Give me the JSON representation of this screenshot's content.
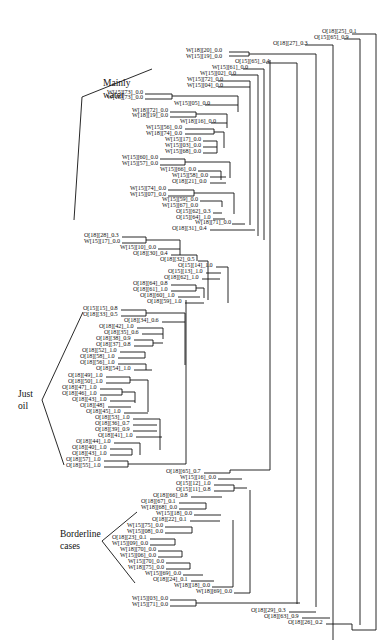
{
  "groups": {
    "mainly_water": {
      "line1": "Mainly",
      "line2": "water"
    },
    "just_oil": {
      "line1": "Just",
      "line2": "oil"
    },
    "borderline": {
      "line1": "Borderline",
      "line2": "cases"
    }
  },
  "leaves": [
    {
      "text": "O[18][25]_0.1",
      "x": 322,
      "y": 31
    },
    {
      "text": "O[15][65]_0.9",
      "x": 314,
      "y": 37
    },
    {
      "text": "O[18][27]_0.3",
      "x": 273,
      "y": 43
    },
    {
      "text": "W[18][20]_0.0",
      "x": 186,
      "y": 50
    },
    {
      "text": "W[15][19]_0.0",
      "x": 186,
      "y": 56
    },
    {
      "text": "O[15][65]_0.4",
      "x": 235,
      "y": 61
    },
    {
      "text": "W[15][61]_0.0",
      "x": 212,
      "y": 67
    },
    {
      "text": "W[15][02]_0.0",
      "x": 200,
      "y": 73
    },
    {
      "text": "W[15][72]_0.0",
      "x": 187,
      "y": 79
    },
    {
      "text": "W[15][04]_0.0",
      "x": 187,
      "y": 85
    },
    {
      "text": "W[15][73]_0.0",
      "x": 107,
      "y": 92
    },
    {
      "text": "W[18][73]_0.0",
      "x": 107,
      "y": 97
    },
    {
      "text": "W[15][05]_0.0",
      "x": 174,
      "y": 103
    },
    {
      "text": "W[18][72]_0.0",
      "x": 132,
      "y": 110
    },
    {
      "text": "W[18][19]_0.0",
      "x": 132,
      "y": 115
    },
    {
      "text": "W[18][16]_0.0",
      "x": 180,
      "y": 121
    },
    {
      "text": "W[15][56]_0.0",
      "x": 146,
      "y": 127
    },
    {
      "text": "W[18][74]_0.0",
      "x": 146,
      "y": 133
    },
    {
      "text": "W[15][17]_0.0",
      "x": 165,
      "y": 139
    },
    {
      "text": "W[15][03]_0.0",
      "x": 165,
      "y": 145
    },
    {
      "text": "W[15][68]_0.0",
      "x": 165,
      "y": 151
    },
    {
      "text": "W[15][60]_0.0",
      "x": 122,
      "y": 157
    },
    {
      "text": "W[15][57]_0.0",
      "x": 122,
      "y": 163
    },
    {
      "text": "W[15][66]_0.0",
      "x": 160,
      "y": 169
    },
    {
      "text": "W[15][58]_0.0",
      "x": 172,
      "y": 175
    },
    {
      "text": "O[18][21]_0.0",
      "x": 172,
      "y": 181
    },
    {
      "text": "W[15][74]_0.0",
      "x": 130,
      "y": 188
    },
    {
      "text": "W[15][07]_0.0",
      "x": 130,
      "y": 194
    },
    {
      "text": "W[15][59]_0.0",
      "x": 162,
      "y": 199
    },
    {
      "text": "W[15][67]_0.0",
      "x": 162,
      "y": 205
    },
    {
      "text": "O[15][62]_0.3",
      "x": 176,
      "y": 211
    },
    {
      "text": "O[15][64]_1.0",
      "x": 176,
      "y": 217
    },
    {
      "text": "W[18][71]_0.0",
      "x": 195,
      "y": 222
    },
    {
      "text": "O[18][31]_0.4",
      "x": 172,
      "y": 228
    },
    {
      "text": "O[18][28]_0.3",
      "x": 84,
      "y": 235
    },
    {
      "text": "W[15][17]_0.0",
      "x": 84,
      "y": 241
    },
    {
      "text": "W[15][10]_0.0",
      "x": 120,
      "y": 247
    },
    {
      "text": "O[18][30]_0.4",
      "x": 133,
      "y": 253
    },
    {
      "text": "O[18][32]_0.5",
      "x": 160,
      "y": 259
    },
    {
      "text": "O[15][14]_1.0",
      "x": 178,
      "y": 265
    },
    {
      "text": "O[15][13]_1.0",
      "x": 168,
      "y": 271
    },
    {
      "text": "O[18][62]_1.0",
      "x": 164,
      "y": 277
    },
    {
      "text": "O[18][64]_0.8",
      "x": 133,
      "y": 283
    },
    {
      "text": "O[18][61]_1.0",
      "x": 133,
      "y": 289
    },
    {
      "text": "O[18][60]_1.0",
      "x": 140,
      "y": 295
    },
    {
      "text": "O[18][59]_1.0",
      "x": 147,
      "y": 301
    },
    {
      "text": "O[15][15]_0.8",
      "x": 83,
      "y": 308
    },
    {
      "text": "O[18][33]_0.5",
      "x": 83,
      "y": 314
    },
    {
      "text": "O[18][34]_0.6",
      "x": 124,
      "y": 320
    },
    {
      "text": "O[18][42]_1.0",
      "x": 99,
      "y": 326
    },
    {
      "text": "O[18][35]_0.6",
      "x": 104,
      "y": 332
    },
    {
      "text": "O[18][38]_0.9",
      "x": 96,
      "y": 338
    },
    {
      "text": "O[18][37]_0.8",
      "x": 96,
      "y": 344
    },
    {
      "text": "O[18][52]_1.0",
      "x": 82,
      "y": 350
    },
    {
      "text": "O[18][58]_1.0",
      "x": 80,
      "y": 356
    },
    {
      "text": "O[18][56]_1.0",
      "x": 80,
      "y": 362
    },
    {
      "text": "O[18][54]_1.0",
      "x": 96,
      "y": 368
    },
    {
      "text": "O[18][49]_1.0",
      "x": 68,
      "y": 375
    },
    {
      "text": "O[18][50]_1.0",
      "x": 68,
      "y": 381
    },
    {
      "text": "O[18][47]_1.0",
      "x": 62,
      "y": 387
    },
    {
      "text": "O[18][46]_1.0",
      "x": 62,
      "y": 393
    },
    {
      "text": "O[18][43]_1.0",
      "x": 72,
      "y": 399
    },
    {
      "text": "O[18][48]",
      "x": 80,
      "y": 405
    },
    {
      "text": "O[18][45]_1.0",
      "x": 86,
      "y": 411
    },
    {
      "text": "O[18][53]_1.0",
      "x": 95,
      "y": 417
    },
    {
      "text": "O[18][36]_0.7",
      "x": 95,
      "y": 423
    },
    {
      "text": "O[18][39]_0.9",
      "x": 95,
      "y": 429
    },
    {
      "text": "O[18][41]_1.0",
      "x": 98,
      "y": 435
    },
    {
      "text": "O[18][44]_1.0",
      "x": 76,
      "y": 441
    },
    {
      "text": "O[18][40]_1.0",
      "x": 72,
      "y": 447
    },
    {
      "text": "O[18][43]_1.0",
      "x": 72,
      "y": 453
    },
    {
      "text": "O[18][57]_1.0",
      "x": 66,
      "y": 459
    },
    {
      "text": "O[18][55]_1.0",
      "x": 66,
      "y": 465
    },
    {
      "text": "O[18][65]_0.7",
      "x": 166,
      "y": 471
    },
    {
      "text": "W[15][16]_0.0",
      "x": 180,
      "y": 477
    },
    {
      "text": "O[15][12]_1.0",
      "x": 176,
      "y": 483
    },
    {
      "text": "O[15][11]_0.8",
      "x": 176,
      "y": 489
    },
    {
      "text": "O[18][66]_0.8",
      "x": 153,
      "y": 495
    },
    {
      "text": "O[18][67]_0.1",
      "x": 141,
      "y": 501
    },
    {
      "text": "W[18][68]_0.0",
      "x": 141,
      "y": 507
    },
    {
      "text": "W[15][18]_0.0",
      "x": 156,
      "y": 513
    },
    {
      "text": "O[18][22]_0.1",
      "x": 152,
      "y": 519
    },
    {
      "text": "W[15][75]_0.0",
      "x": 127,
      "y": 525
    },
    {
      "text": "W[15][08]_0.0",
      "x": 127,
      "y": 531
    },
    {
      "text": "O[18][23]_0.1",
      "x": 112,
      "y": 537
    },
    {
      "text": "W[15][09]_0.0",
      "x": 112,
      "y": 543
    },
    {
      "text": "W[18][70]_0.0",
      "x": 120,
      "y": 549
    },
    {
      "text": "W[15][06]_0.0",
      "x": 120,
      "y": 555
    },
    {
      "text": "W[15][70]_0.0",
      "x": 128,
      "y": 561
    },
    {
      "text": "W[18][75]_0.0",
      "x": 128,
      "y": 567
    },
    {
      "text": "W[15][69]_0.0",
      "x": 145,
      "y": 573
    },
    {
      "text": "O[18][24]_0.1",
      "x": 153,
      "y": 579
    },
    {
      "text": "W[18][18]_0.0",
      "x": 174,
      "y": 585
    },
    {
      "text": "W[18][69]_0.0",
      "x": 196,
      "y": 591
    },
    {
      "text": "W[15][03]_0.0",
      "x": 132,
      "y": 598
    },
    {
      "text": "W[15][71]_0.0",
      "x": 132,
      "y": 604
    },
    {
      "text": "O[18][29]_0.3",
      "x": 251,
      "y": 610
    },
    {
      "text": "O[18][63]_0.9",
      "x": 264,
      "y": 616
    },
    {
      "text": "O[18][26]_0.2",
      "x": 288,
      "y": 622
    }
  ]
}
